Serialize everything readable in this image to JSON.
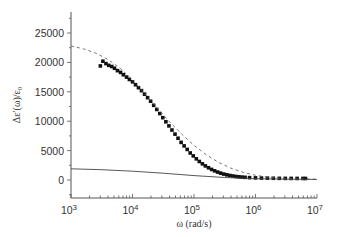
{
  "chart_data": {
    "type": "scatter",
    "title": "",
    "xlabel": "ω (rad/s)",
    "ylabel": "Δε′(ω)/ε₀",
    "xscale": "log",
    "xlim": [
      1000,
      10000000
    ],
    "ylim": [
      -2500,
      28000
    ],
    "grid": false,
    "legend": null,
    "x_ticks": [
      {
        "value": 1000,
        "base": "10",
        "exp": "3"
      },
      {
        "value": 10000,
        "base": "10",
        "exp": "4"
      },
      {
        "value": 100000,
        "base": "10",
        "exp": "5"
      },
      {
        "value": 1000000,
        "base": "10",
        "exp": "6"
      },
      {
        "value": 10000000,
        "base": "10",
        "exp": "7"
      }
    ],
    "y_ticks": [
      0,
      5000,
      10000,
      15000,
      20000,
      25000
    ],
    "y_tick_labels": [
      "0",
      "5000",
      "10000",
      "15000",
      "20000",
      "25000"
    ],
    "series": [
      {
        "name": "measured",
        "style": "square-markers",
        "color": "#111111",
        "x": [
          3000,
          3300,
          3700,
          4100,
          4600,
          5100,
          5700,
          6400,
          7100,
          8000,
          8900,
          10000,
          11200,
          12500,
          14000,
          15700,
          17600,
          19700,
          22100,
          24800,
          27800,
          31100,
          34900,
          39100,
          43800,
          49100,
          55000,
          61700,
          69100,
          77500,
          86800,
          97300,
          109000,
          122000,
          137000,
          153000,
          172000,
          193000,
          216000,
          242000,
          271000,
          304000,
          341000,
          382000,
          428000,
          480000,
          538000,
          603000,
          676000,
          800000,
          1000000,
          1250000,
          1560000,
          1950000,
          2440000,
          3050000,
          3800000,
          4750000,
          5900000,
          6500000
        ],
        "y": [
          19400,
          20200,
          19800,
          19500,
          19300,
          19000,
          18600,
          18300,
          17900,
          17500,
          17100,
          16700,
          16200,
          15700,
          15200,
          14600,
          14000,
          13400,
          12700,
          12000,
          11300,
          10600,
          9900,
          9200,
          8500,
          7800,
          7100,
          6400,
          5800,
          5200,
          4600,
          4100,
          3600,
          3150,
          2750,
          2400,
          2080,
          1800,
          1560,
          1350,
          1170,
          1010,
          880,
          770,
          680,
          600,
          540,
          490,
          450,
          400,
          360,
          330,
          310,
          295,
          285,
          275,
          270,
          265,
          260,
          260
        ]
      },
      {
        "name": "dashed-fit",
        "style": "dashed-line",
        "color": "#666666",
        "x": [
          1000,
          1600,
          2500,
          4000,
          6300,
          10000,
          15800,
          25100,
          39800,
          63100,
          100000,
          158000,
          251000,
          398000,
          631000,
          1000000,
          1580000,
          2510000,
          3980000,
          6310000,
          10000000
        ],
        "y": [
          22800,
          22300,
          21600,
          20500,
          19000,
          17000,
          14700,
          12300,
          9900,
          7800,
          5900,
          4300,
          3000,
          2000,
          1300,
          800,
          500,
          320,
          220,
          160,
          130
        ]
      },
      {
        "name": "solid-line",
        "style": "solid-line",
        "color": "#444444",
        "x": [
          1000,
          3160,
          10000,
          31600,
          100000,
          316000,
          1000000,
          3160000,
          10000000
        ],
        "y": [
          1900,
          1750,
          1500,
          1150,
          750,
          420,
          220,
          130,
          100
        ]
      }
    ]
  }
}
